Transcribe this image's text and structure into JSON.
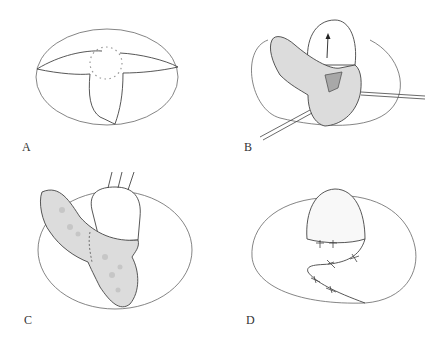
{
  "figure": {
    "panels": [
      {
        "id": "A",
        "label": "A",
        "description": "Oval wound with T-shaped incision flaps and dotted circular lesion outline"
      },
      {
        "id": "B",
        "label": "B",
        "description": "Flap raised with arrow indicating advancement; shaded lesion area; two instruments retracting"
      },
      {
        "id": "C",
        "label": "C",
        "description": "Flap rotated with three sutures/hooks pulling upward; dashed line on stippled tissue"
      },
      {
        "id": "D",
        "label": "D",
        "description": "Closure with interrupted sutures along flap margins"
      }
    ]
  },
  "colors": {
    "line": "#555555",
    "tissue_fill": "#dcdcdc",
    "tissue_spot": "#c8c8c8",
    "lesion_fill": "#a8a8a8",
    "background": "#ffffff"
  }
}
